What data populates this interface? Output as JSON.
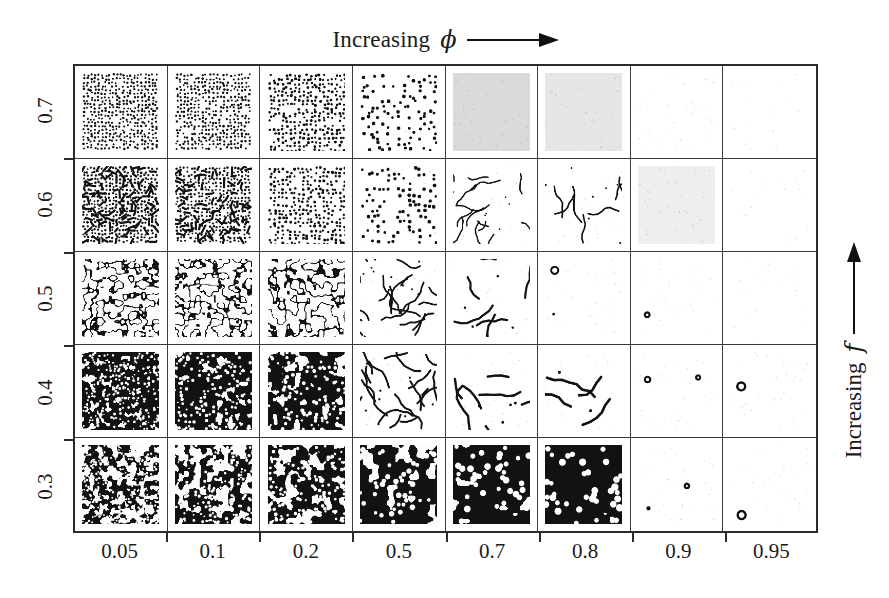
{
  "figure": {
    "background_color": "#ffffff",
    "ink_color": "#111111",
    "grid_line_color": "#3a3a3a"
  },
  "axes": {
    "top": {
      "label_text": "Increasing",
      "symbol": "ϕ",
      "arrow": "right-arrow",
      "arrow_direction": "right"
    },
    "right": {
      "label_text": "Increasing",
      "symbol": "f",
      "arrow": "up-arrow",
      "arrow_direction": "up"
    },
    "x_tick_labels": [
      "0.05",
      "0.1",
      "0.2",
      "0.5",
      "0.7",
      "0.8",
      "0.9",
      "0.95"
    ],
    "y_tick_labels": [
      "0.7",
      "0.6",
      "0.5",
      "0.4",
      "0.3"
    ]
  },
  "chart_data": {
    "type": "heatmap",
    "title": "",
    "subtitle": "",
    "xlabel": "Increasing ϕ",
    "ylabel": "Increasing f",
    "legend": [],
    "grid": true,
    "rows": 5,
    "cols": 8,
    "x": [
      0.05,
      0.1,
      0.2,
      0.5,
      0.7,
      0.8,
      0.9,
      0.95
    ],
    "y": [
      0.7,
      0.6,
      0.5,
      0.4,
      0.3
    ],
    "x_axis_variable": "phi",
    "y_axis_variable": "f",
    "note": "Each grid cell holds a simulated reaction-diffusion pattern snapshot; cell values below encode the morphology class, ink coverage fraction and feature scale read from the image.",
    "morphology_legend": {
      "spots": "dark spots on light background",
      "spots-worms": "mixture of dark spots and short dark filaments",
      "labyrinth": "connected dark labyrinthine stripes",
      "inverse-cells": "dark background with light cellular holes",
      "inverse-blobs": "dark background with large light blobs",
      "worms": "isolated curved dark filaments",
      "rings": "isolated dark rings / annuli",
      "uniform-gray": "featureless uniform mid-gray state",
      "uniform-white": "featureless near-white state"
    },
    "cells": [
      [
        {
          "phi": 0.05,
          "f": 0.7,
          "morphology": "spots",
          "coverage": 0.38,
          "feature_scale": 7,
          "seed": 101
        },
        {
          "phi": 0.1,
          "f": 0.7,
          "morphology": "spots",
          "coverage": 0.34,
          "feature_scale": 7,
          "seed": 102
        },
        {
          "phi": 0.2,
          "f": 0.7,
          "morphology": "spots",
          "coverage": 0.3,
          "feature_scale": 8,
          "seed": 103
        },
        {
          "phi": 0.5,
          "f": 0.7,
          "morphology": "spots",
          "coverage": 0.17,
          "feature_scale": 10,
          "seed": 104
        },
        {
          "phi": 0.7,
          "f": 0.7,
          "morphology": "uniform-gray",
          "coverage": 0.22,
          "feature_scale": 0,
          "seed": 105
        },
        {
          "phi": 0.8,
          "f": 0.7,
          "morphology": "uniform-gray",
          "coverage": 0.15,
          "feature_scale": 0,
          "seed": 106
        },
        {
          "phi": 0.9,
          "f": 0.7,
          "morphology": "uniform-white",
          "coverage": 0.04,
          "feature_scale": 0,
          "seed": 107
        },
        {
          "phi": 0.95,
          "f": 0.7,
          "morphology": "uniform-white",
          "coverage": 0.02,
          "feature_scale": 0,
          "seed": 108
        }
      ],
      [
        {
          "phi": 0.05,
          "f": 0.6,
          "morphology": "spots-worms",
          "coverage": 0.42,
          "feature_scale": 7,
          "seed": 201
        },
        {
          "phi": 0.1,
          "f": 0.6,
          "morphology": "spots-worms",
          "coverage": 0.38,
          "feature_scale": 7,
          "seed": 202
        },
        {
          "phi": 0.2,
          "f": 0.6,
          "morphology": "spots",
          "coverage": 0.3,
          "feature_scale": 8,
          "seed": 203
        },
        {
          "phi": 0.5,
          "f": 0.6,
          "morphology": "spots",
          "coverage": 0.16,
          "feature_scale": 10,
          "seed": 204
        },
        {
          "phi": 0.7,
          "f": 0.6,
          "morphology": "worms",
          "coverage": 0.1,
          "feature_scale": 13,
          "seed": 205
        },
        {
          "phi": 0.8,
          "f": 0.6,
          "morphology": "worms",
          "coverage": 0.09,
          "feature_scale": 15,
          "seed": 206
        },
        {
          "phi": 0.9,
          "f": 0.6,
          "morphology": "uniform-gray",
          "coverage": 0.1,
          "feature_scale": 0,
          "seed": 207
        },
        {
          "phi": 0.95,
          "f": 0.6,
          "morphology": "uniform-white",
          "coverage": 0.02,
          "feature_scale": 0,
          "seed": 208
        }
      ],
      [
        {
          "phi": 0.05,
          "f": 0.5,
          "morphology": "labyrinth",
          "coverage": 0.48,
          "feature_scale": 12,
          "seed": 301
        },
        {
          "phi": 0.1,
          "f": 0.5,
          "morphology": "labyrinth",
          "coverage": 0.45,
          "feature_scale": 11,
          "seed": 302
        },
        {
          "phi": 0.2,
          "f": 0.5,
          "morphology": "labyrinth",
          "coverage": 0.4,
          "feature_scale": 13,
          "seed": 303
        },
        {
          "phi": 0.5,
          "f": 0.5,
          "morphology": "worms",
          "coverage": 0.22,
          "feature_scale": 16,
          "seed": 304
        },
        {
          "phi": 0.7,
          "f": 0.5,
          "morphology": "worms",
          "coverage": 0.12,
          "feature_scale": 20,
          "seed": 305
        },
        {
          "phi": 0.8,
          "f": 0.5,
          "morphology": "rings",
          "coverage": 0.08,
          "feature_scale": 24,
          "seed": 306
        },
        {
          "phi": 0.9,
          "f": 0.5,
          "morphology": "rings",
          "coverage": 0.04,
          "feature_scale": 26,
          "seed": 307
        },
        {
          "phi": 0.95,
          "f": 0.5,
          "morphology": "uniform-white",
          "coverage": 0.02,
          "feature_scale": 0,
          "seed": 308
        }
      ],
      [
        {
          "phi": 0.05,
          "f": 0.4,
          "morphology": "inverse-cells",
          "coverage": 0.62,
          "feature_scale": 10,
          "seed": 401
        },
        {
          "phi": 0.1,
          "f": 0.4,
          "morphology": "inverse-cells",
          "coverage": 0.58,
          "feature_scale": 12,
          "seed": 402
        },
        {
          "phi": 0.2,
          "f": 0.4,
          "morphology": "inverse-cells",
          "coverage": 0.54,
          "feature_scale": 14,
          "seed": 403
        },
        {
          "phi": 0.5,
          "f": 0.4,
          "morphology": "worms",
          "coverage": 0.24,
          "feature_scale": 18,
          "seed": 404
        },
        {
          "phi": 0.7,
          "f": 0.4,
          "morphology": "worms",
          "coverage": 0.14,
          "feature_scale": 22,
          "seed": 405
        },
        {
          "phi": 0.8,
          "f": 0.4,
          "morphology": "worms",
          "coverage": 0.1,
          "feature_scale": 24,
          "seed": 406
        },
        {
          "phi": 0.9,
          "f": 0.4,
          "morphology": "rings",
          "coverage": 0.06,
          "feature_scale": 26,
          "seed": 407
        },
        {
          "phi": 0.95,
          "f": 0.4,
          "morphology": "rings",
          "coverage": 0.03,
          "feature_scale": 28,
          "seed": 408
        }
      ],
      [
        {
          "phi": 0.05,
          "f": 0.3,
          "morphology": "inverse-blobs",
          "coverage": 0.76,
          "feature_scale": 9,
          "seed": 501
        },
        {
          "phi": 0.1,
          "f": 0.3,
          "morphology": "inverse-blobs",
          "coverage": 0.72,
          "feature_scale": 11,
          "seed": 502
        },
        {
          "phi": 0.2,
          "f": 0.3,
          "morphology": "inverse-blobs",
          "coverage": 0.66,
          "feature_scale": 13,
          "seed": 503
        },
        {
          "phi": 0.5,
          "f": 0.3,
          "morphology": "inverse-blobs",
          "coverage": 0.44,
          "feature_scale": 20,
          "seed": 504
        },
        {
          "phi": 0.7,
          "f": 0.3,
          "morphology": "inverse-blobs",
          "coverage": 0.3,
          "feature_scale": 24,
          "seed": 505
        },
        {
          "phi": 0.8,
          "f": 0.3,
          "morphology": "inverse-blobs",
          "coverage": 0.22,
          "feature_scale": 26,
          "seed": 506
        },
        {
          "phi": 0.9,
          "f": 0.3,
          "morphology": "rings",
          "coverage": 0.07,
          "feature_scale": 28,
          "seed": 507
        },
        {
          "phi": 0.95,
          "f": 0.3,
          "morphology": "rings",
          "coverage": 0.04,
          "feature_scale": 28,
          "seed": 508
        }
      ]
    ]
  }
}
